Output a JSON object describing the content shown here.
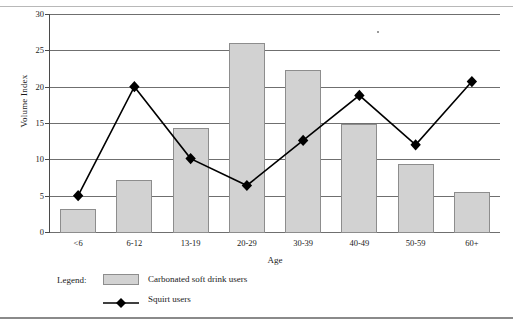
{
  "chart_data": {
    "type": "bar",
    "title": "",
    "xlabel": "Age",
    "ylabel": "Volume Index",
    "categories": [
      "<6",
      "6-12",
      "13-19",
      "20-29",
      "30-39",
      "40-49",
      "50-59",
      "60+"
    ],
    "ylim": [
      0,
      30
    ],
    "yticks": [
      0,
      5,
      10,
      15,
      20,
      25,
      30
    ],
    "grid": true,
    "legend_position": "below-plot-left",
    "series": [
      {
        "name": "Carbonated soft drink users",
        "type": "bar",
        "color": "#d2d2d2",
        "border_color": "#8d8d8d",
        "values": [
          3.2,
          7.2,
          14.3,
          26.0,
          22.3,
          14.9,
          9.4,
          5.5
        ]
      },
      {
        "name": "Squirt users",
        "type": "line",
        "color": "#000000",
        "marker": "diamond",
        "values": [
          5.0,
          20.0,
          10.1,
          6.4,
          12.6,
          18.8,
          12.0,
          20.7
        ]
      }
    ]
  },
  "legend": {
    "title": "Legend:",
    "bar_label": "Carbonated soft drink users",
    "line_label": "Squirt users"
  }
}
